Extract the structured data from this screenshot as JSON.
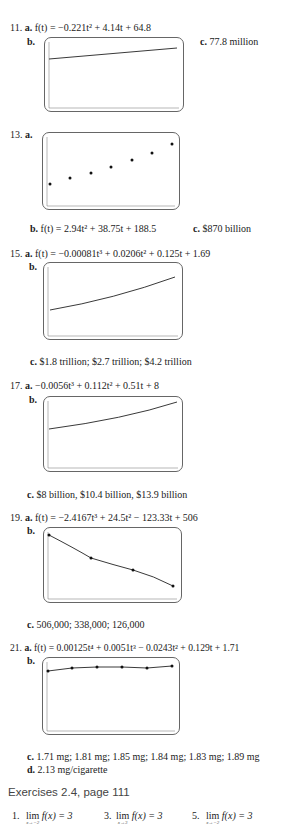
{
  "problems": [
    {
      "number": "11.",
      "a": {
        "label": "a.",
        "text": "f(t) = −0.221t² + 4.14t + 64.8"
      },
      "b": {
        "label": "b."
      },
      "c": {
        "label": "c.",
        "text": "77.8 million"
      }
    },
    {
      "number": "13.",
      "a": {
        "label": "a."
      },
      "b": {
        "label": "b.",
        "text": "f(t) = 2.94t² + 38.75t + 188.5"
      },
      "c": {
        "label": "c.",
        "text": "$870 billion"
      }
    },
    {
      "number": "15.",
      "a": {
        "label": "a.",
        "text": "f(t) = −0.00081t³ + 0.0206t² + 0.125t + 1.69"
      },
      "b": {
        "label": "b."
      },
      "c": {
        "label": "c.",
        "text": "$1.8 trillion; $2.7 trillion; $4.2 trillion"
      }
    },
    {
      "number": "17.",
      "a": {
        "label": "a.",
        "text": "−0.0056t³ + 0.112t² + 0.51t + 8"
      },
      "b": {
        "label": "b."
      },
      "c": {
        "label": "c.",
        "text": "$8 billion, $10.4 billion, $13.9 billion"
      }
    },
    {
      "number": "19.",
      "a": {
        "label": "a.",
        "text": "f(t) = −2.4167t³ + 24.5t² − 123.33t + 506"
      },
      "b": {
        "label": "b."
      },
      "c": {
        "label": "c.",
        "text": "506,000; 338,000; 126,000"
      }
    },
    {
      "number": "21.",
      "a": {
        "label": "a.",
        "text": "f(t) = 0.00125t⁴ + 0.0051t³ − 0.0243t² + 0.129t + 1.71"
      },
      "b": {
        "label": "b."
      },
      "c": {
        "label": "c.",
        "text": "1.71 mg; 1.81 mg; 1.85 mg; 1.84 mg; 1.83 mg; 1.89 mg"
      },
      "d": {
        "label": "d.",
        "text": "2.13 mg/cigarette"
      }
    }
  ],
  "section": {
    "title": "Exercises 2.4, page 111",
    "answers": [
      {
        "number": "1.",
        "lim": "lim",
        "sub": "x→−2",
        "expr": "f(x) = 3"
      },
      {
        "number": "3.",
        "lim": "lim",
        "sub": "x→3",
        "expr": "f(x) = 3"
      },
      {
        "number": "5.",
        "lim": "lim",
        "sub": "x→−2",
        "expr": "f(x) = 3"
      }
    ]
  },
  "graphs": {
    "g11": {
      "type": "line",
      "description": "slightly rising line",
      "points": [
        [
          0,
          0.64
        ],
        [
          1,
          0.86
        ]
      ]
    },
    "g13": {
      "type": "scatter",
      "points": [
        [
          0,
          0.27
        ],
        [
          1,
          0.38
        ],
        [
          2,
          0.47
        ],
        [
          3,
          0.58
        ],
        [
          4,
          0.7
        ],
        [
          5,
          0.82
        ],
        [
          6,
          0.98
        ]
      ]
    },
    "g15": {
      "type": "line",
      "description": "increasing convex curve"
    },
    "g17": {
      "type": "line",
      "description": "increasing convex curve"
    },
    "g19": {
      "type": "line+points",
      "points": [
        [
          0,
          0.9
        ],
        [
          2,
          0.57
        ],
        [
          4,
          0.33
        ],
        [
          6,
          0.06
        ]
      ]
    },
    "g21": {
      "type": "line+points",
      "points": [
        [
          0,
          0.85
        ],
        [
          1,
          0.94
        ],
        [
          2,
          0.96
        ],
        [
          3,
          0.95
        ],
        [
          4,
          0.94
        ],
        [
          5,
          0.98
        ]
      ]
    }
  }
}
